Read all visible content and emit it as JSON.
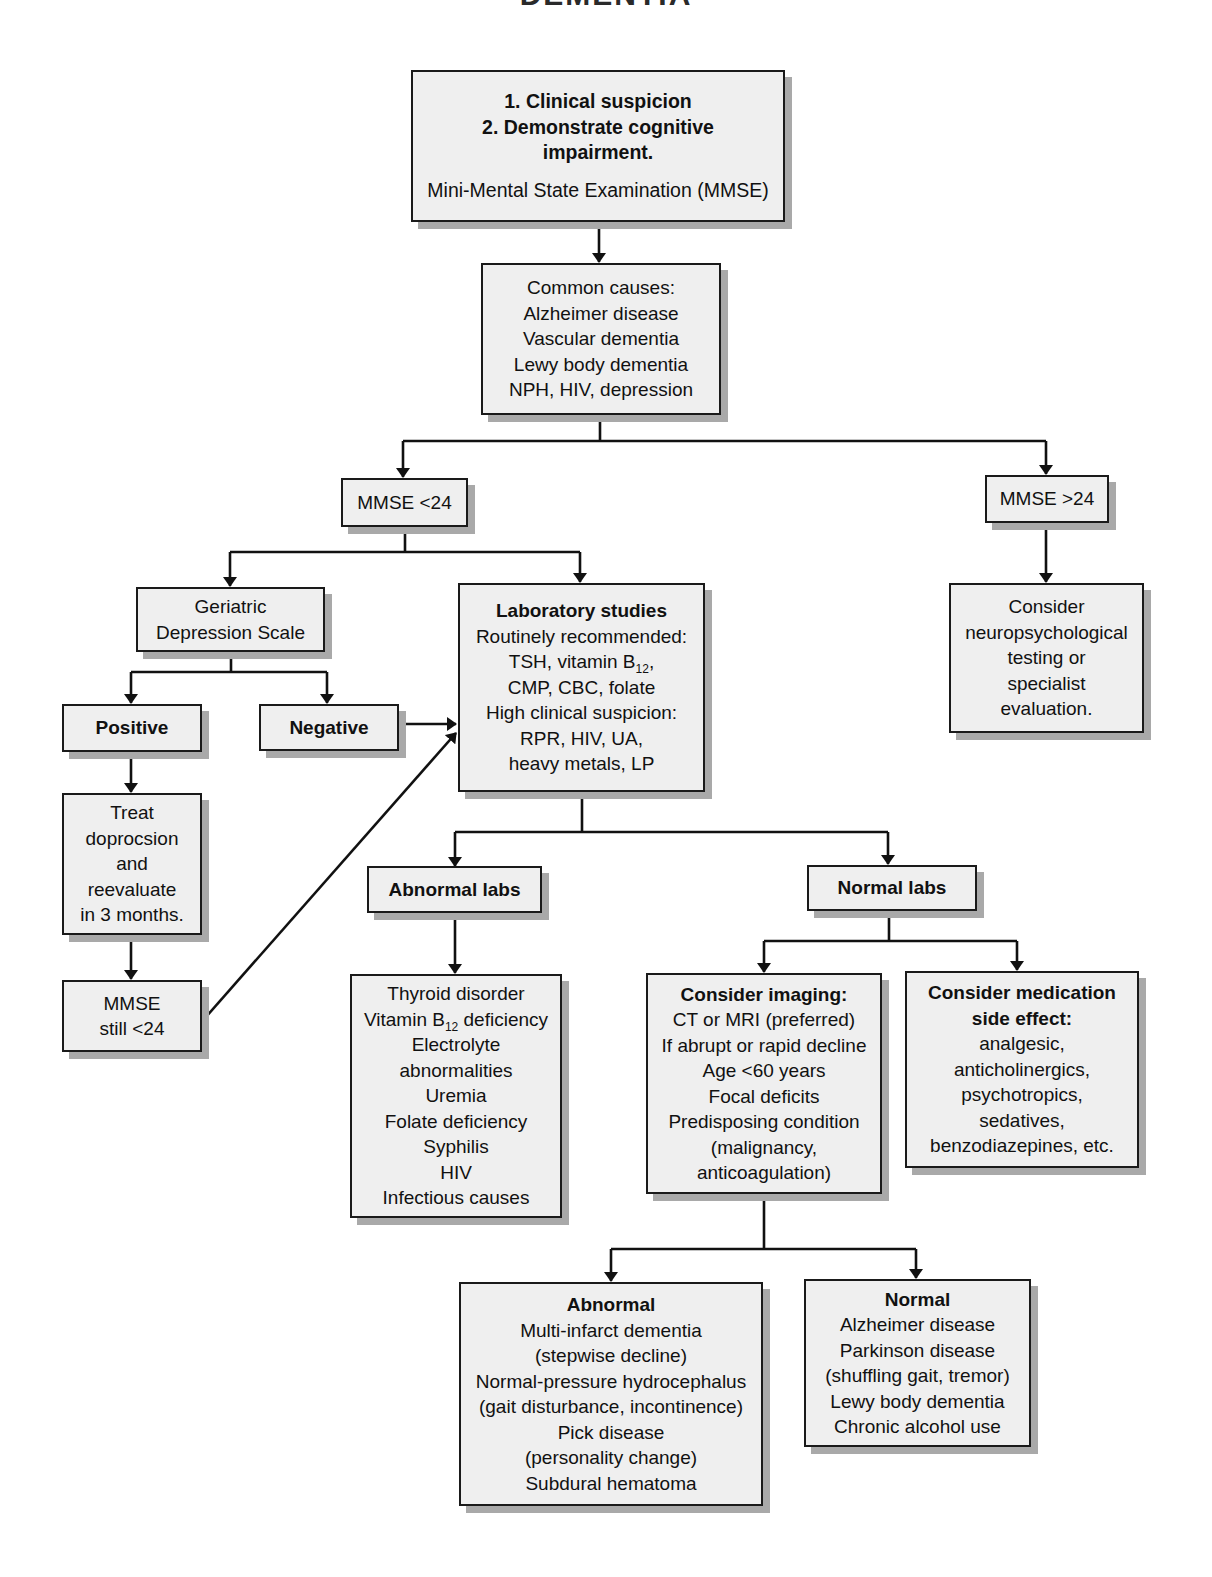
{
  "title": "DEMENTIA",
  "nodes": {
    "start": {
      "lines": [
        "1. Clinical suspicion",
        "2. Demonstrate cognitive",
        "impairment."
      ],
      "sub": "Mini-Mental State Examination (MMSE)"
    },
    "causes": {
      "lines": [
        "Common causes:",
        "Alzheimer disease",
        "Vascular dementia",
        "Lewy body dementia",
        "NPH, HIV, depression"
      ]
    },
    "mmse_low": {
      "label": "MMSE <24"
    },
    "mmse_high": {
      "label": "MMSE >24"
    },
    "neuropsych": {
      "lines": [
        "Consider",
        "neuropsychological",
        "testing or",
        "specialist",
        "evaluation."
      ]
    },
    "gds": {
      "lines": [
        "Geriatric",
        "Depression Scale"
      ]
    },
    "positive": {
      "label": "Positive"
    },
    "negative": {
      "label": "Negative"
    },
    "treat": {
      "lines": [
        "Treat",
        "doprocsion",
        "and",
        "reevaluate",
        "in 3 months."
      ]
    },
    "mmse_still": {
      "lines": [
        "MMSE",
        "still <24"
      ]
    },
    "labs": {
      "heading": "Laboratory studies",
      "line1": "Routinely recommended:",
      "line2_pre": "TSH, vitamin B",
      "line2_sub": "12",
      "line2_post": ",",
      "line3": "CMP, CBC, folate",
      "line4": "High clinical suspicion:",
      "line5": "RPR, HIV, UA,",
      "line6": "heavy metals, LP"
    },
    "abnormal_labs": {
      "label": "Abnormal labs"
    },
    "normal_labs": {
      "label": "Normal labs"
    },
    "abnormal_list": {
      "line1": "Thyroid disorder",
      "line2_pre": "Vitamin B",
      "line2_sub": "12",
      "line2_post": " deficiency",
      "rest": [
        "Electrolyte",
        "abnormalities",
        "Uremia",
        "Folate deficiency",
        "Syphilis",
        "HIV",
        "Infectious causes"
      ]
    },
    "imaging": {
      "heading": "Consider imaging:",
      "lines": [
        "CT or MRI (preferred)",
        "If abrupt or rapid decline",
        "Age <60 years",
        "Focal deficits",
        "Predisposing condition",
        "(malignancy,",
        "anticoagulation)"
      ]
    },
    "medication": {
      "heading_lines": [
        "Consider medication",
        "side effect:"
      ],
      "lines": [
        "analgesic,",
        "anticholinergics,",
        "psychotropics,",
        "sedatives,",
        "benzodiazepines, etc."
      ]
    },
    "imaging_abnormal": {
      "heading": "Abnormal",
      "lines": [
        "Multi-infarct dementia",
        "(stepwise decline)",
        "Normal-pressure hydrocephalus",
        "(gait disturbance, incontinence)",
        "Pick disease",
        "(personality change)",
        "Subdural hematoma"
      ]
    },
    "imaging_normal": {
      "heading": "Normal",
      "lines": [
        "Alzheimer disease",
        "Parkinson disease",
        "(shuffling gait, tremor)",
        "Lewy body dementia",
        "Chronic alcohol use"
      ]
    }
  }
}
